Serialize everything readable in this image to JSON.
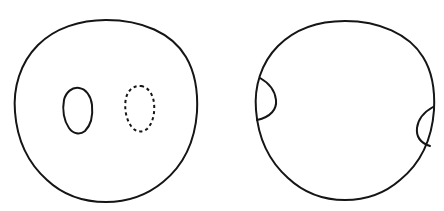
{
  "figure": {
    "title": "Two disks with marked curves",
    "background_color": "#ffffff",
    "stroke_color": "#151515",
    "stroke_width": 2,
    "canvas": {
      "width": 444,
      "height": 211
    }
  },
  "panels": [
    {
      "id": "left-panel",
      "label": "Left disk with two interior simple closed curves",
      "boundary": {
        "name": "left-disk-boundary",
        "shape": "circle",
        "center_x": 106,
        "center_y": 111,
        "radius": 91,
        "style": "solid"
      },
      "curves": [
        {
          "name": "interior-solid-ellipse",
          "shape": "ellipse",
          "center_x": 77,
          "center_y": 110,
          "radius_x": 15,
          "radius_y": 22,
          "rotation_deg": 12,
          "style": "solid",
          "description": "small solid closed curve in the interior"
        },
        {
          "name": "interior-dashed-ellipse",
          "shape": "ellipse",
          "center_x": 139,
          "center_y": 108,
          "radius_x": 15,
          "radius_y": 22,
          "rotation_deg": 10,
          "style": "dashed",
          "description": "small dashed closed curve in the interior"
        }
      ]
    },
    {
      "id": "right-panel",
      "label": "Right disk with two boundary-touching lens regions",
      "boundary": {
        "name": "right-disk-boundary",
        "shape": "circle",
        "center_x": 345,
        "center_y": 110,
        "radius": 89,
        "style": "solid"
      },
      "curves": [
        {
          "name": "left-boundary-lens-arc",
          "shape": "arc",
          "start_x": 260,
          "start_y": 78,
          "end_x": 257,
          "end_y": 120,
          "bulge_x": 277,
          "bulge_y": 99,
          "style": "solid",
          "description": "arc meeting the boundary at two points on the left, bulging inward"
        },
        {
          "name": "right-boundary-lens-arc",
          "shape": "arc",
          "start_x": 433,
          "start_y": 107,
          "end_x": 430,
          "end_y": 146,
          "bulge_x": 417,
          "bulge_y": 127,
          "style": "solid",
          "description": "arc meeting the boundary at two points on the right, bulging inward"
        }
      ]
    }
  ],
  "annotations": {
    "text_labels": []
  }
}
